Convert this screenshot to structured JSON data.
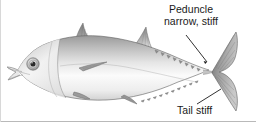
{
  "figure": {
    "style": "grayscale-scientific-illustration",
    "background_color": "#ffffff",
    "ink_color": "#1a1a1a",
    "body_light": "#f2f2f2",
    "body_mid": "#b8b8b8",
    "body_dark": "#6e6e6e",
    "fin_color": "#8a8a8a"
  },
  "annotations": {
    "peduncle": {
      "line1": "Peduncle",
      "line2": "narrow, stiff",
      "leader_from_x": 186,
      "leader_from_y": 35,
      "leader_to_x": 207,
      "leader_to_y": 62
    },
    "tail": {
      "label": "Tail stiff",
      "leader_from_x": 197,
      "leader_from_y": 104,
      "leader_to_x": 221,
      "leader_to_y": 89
    }
  },
  "anatomy": {
    "eye": "fish-eye",
    "first_dorsal_fin": "first-dorsal-fin",
    "second_dorsal_fin": "second-dorsal-fin",
    "pectoral_fin": "pectoral-fin",
    "pelvic_fin": "pelvic-fin",
    "anal_fin": "anal-fin",
    "caudal_fin": "caudal-fin-lunate",
    "dorsal_finlets": "dorsal-finlets",
    "ventral_finlets": "ventral-finlets",
    "mouth": "mouth",
    "gill_cover": "operculum",
    "lateral_line": "lateral-line"
  }
}
